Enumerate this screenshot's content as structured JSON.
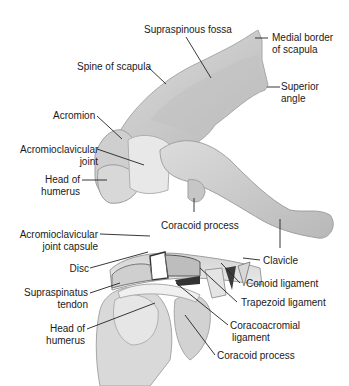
{
  "figure": {
    "top_view_labels": {
      "supraspinous_fossa": "Supraspinous fossa",
      "medial_border": [
        "Medial border",
        "of scapula"
      ],
      "spine_of_scapula": "Spine of scapula",
      "superior_angle": [
        "Superior",
        "angle"
      ],
      "acromion": "Acromion",
      "acromioclavicular_joint": [
        "Acromioclavicular",
        "joint"
      ],
      "head_of_humerus": [
        "Head of",
        "humerus"
      ],
      "coracoid_process": "Coracoid process"
    },
    "bottom_view_labels": {
      "ac_joint_capsule": [
        "Acromioclavicular",
        "joint capsule"
      ],
      "clavicle": "Clavicle",
      "disc": "Disc",
      "conoid_ligament": "Conoid ligament",
      "supraspinatus_tendon": [
        "Supraspinatus",
        "tendon"
      ],
      "trapezoid_ligament": "Trapezoid ligament",
      "head_of_humerus": [
        "Head of",
        "humerus"
      ],
      "coracoacromial_ligament": [
        "Coracoacromial",
        "ligament"
      ],
      "coracoid_process": "Coracoid process"
    },
    "colors": {
      "bone": "#c9c9c9",
      "bone_light": "#e2e2e2",
      "bone_dark": "#9a9a9a",
      "leader": "#222222"
    }
  }
}
